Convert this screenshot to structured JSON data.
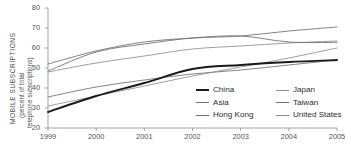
{
  "chart_data": {
    "type": "line",
    "title": "",
    "xlabel": "",
    "ylabel": "MOBILE SUBSCRIPTIONS (percent of total telephone subscriptions)",
    "ylabel_lines": [
      "MOBILE SUBSCRIPTIONS",
      "(percent of total",
      "telephone subscriptions)"
    ],
    "x": [
      1999,
      2000,
      2001,
      2002,
      2003,
      2004,
      2005
    ],
    "xtick_labels": [
      "1999",
      "2000",
      "2001",
      "2002",
      "2003",
      "2004",
      "2005"
    ],
    "ytick_labels": [
      "20",
      "30",
      "40",
      "50",
      "60",
      "70",
      "80"
    ],
    "yticks": [
      20,
      30,
      40,
      50,
      60,
      70,
      80
    ],
    "ylim": [
      20,
      80
    ],
    "xlim": [
      1999,
      2005
    ],
    "grid": false,
    "legend_position": "inside-bottom-right",
    "series": [
      {
        "name": "China",
        "color": "#1a1a1a",
        "width": 1.9,
        "emphasis": true,
        "values": [
          28.0,
          36.0,
          42.5,
          49.5,
          51.5,
          53.0,
          54.0
        ]
      },
      {
        "name": "Asia",
        "color": "#6e6e74",
        "width": 0.85,
        "emphasis": false,
        "values": [
          35.5,
          40.5,
          44.0,
          47.0,
          49.0,
          51.5,
          54.0
        ]
      },
      {
        "name": "Hong Kong",
        "color": "#6e6e74",
        "width": 0.85,
        "emphasis": false,
        "values": [
          52.0,
          58.5,
          63.0,
          65.0,
          66.0,
          68.5,
          70.5
        ]
      },
      {
        "name": "Japan",
        "color": "#8d8d93",
        "width": 0.85,
        "emphasis": false,
        "values": [
          48.0,
          52.5,
          56.0,
          59.5,
          61.0,
          62.5,
          63.5
        ]
      },
      {
        "name": "Taiwan",
        "color": "#6e6e74",
        "width": 0.85,
        "emphasis": false,
        "values": [
          48.5,
          58.0,
          62.0,
          65.0,
          66.0,
          63.0,
          62.8
        ]
      },
      {
        "name": "United States",
        "color": "#8d8d93",
        "width": 0.85,
        "emphasis": false,
        "values": [
          31.0,
          36.0,
          41.0,
          46.0,
          50.5,
          55.0,
          60.0
        ]
      }
    ],
    "legend": {
      "left_column": [
        "China",
        "Asia",
        "Hong Kong"
      ],
      "right_column": [
        "Japan",
        "Taiwan",
        "United States"
      ]
    },
    "axis_color": "#9a9a9e",
    "text_color": "#55545a"
  }
}
